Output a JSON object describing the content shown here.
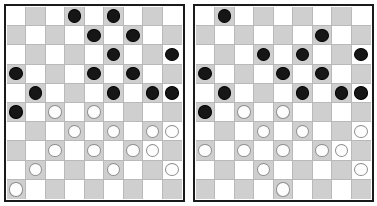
{
  "page": {
    "background": "#ffffff",
    "width": 377,
    "height": 206
  },
  "palette": {
    "light_square": "#ffffff",
    "dark_square": "#cfcfcf",
    "gridline": "#b9b9b9",
    "board_border": "#1a1a1a",
    "black_piece": "#161616",
    "white_piece": "#fdfdfd",
    "white_piece_outline": "#8e8e8e"
  },
  "boards": [
    {
      "id": "board-left",
      "label": "Left board",
      "columns": 9,
      "rows": 10,
      "piece_counts": {
        "black": 14,
        "white": 14
      },
      "pieces": [
        {
          "row": 0,
          "col": 3,
          "color": "black"
        },
        {
          "row": 0,
          "col": 5,
          "color": "black"
        },
        {
          "row": 1,
          "col": 4,
          "color": "black"
        },
        {
          "row": 1,
          "col": 6,
          "color": "black"
        },
        {
          "row": 2,
          "col": 5,
          "color": "black"
        },
        {
          "row": 2,
          "col": 8,
          "color": "black"
        },
        {
          "row": 3,
          "col": 0,
          "color": "black"
        },
        {
          "row": 3,
          "col": 4,
          "color": "black"
        },
        {
          "row": 3,
          "col": 6,
          "color": "black"
        },
        {
          "row": 4,
          "col": 1,
          "color": "black"
        },
        {
          "row": 4,
          "col": 5,
          "color": "black"
        },
        {
          "row": 4,
          "col": 7,
          "color": "black"
        },
        {
          "row": 4,
          "col": 8,
          "color": "black"
        },
        {
          "row": 5,
          "col": 0,
          "color": "black"
        },
        {
          "row": 5,
          "col": 2,
          "color": "white"
        },
        {
          "row": 5,
          "col": 4,
          "color": "white"
        },
        {
          "row": 6,
          "col": 3,
          "color": "white"
        },
        {
          "row": 6,
          "col": 5,
          "color": "white"
        },
        {
          "row": 6,
          "col": 7,
          "color": "white"
        },
        {
          "row": 6,
          "col": 8,
          "color": "white"
        },
        {
          "row": 7,
          "col": 2,
          "color": "white"
        },
        {
          "row": 7,
          "col": 4,
          "color": "white"
        },
        {
          "row": 7,
          "col": 6,
          "color": "white"
        },
        {
          "row": 7,
          "col": 7,
          "color": "white"
        },
        {
          "row": 8,
          "col": 1,
          "color": "white"
        },
        {
          "row": 8,
          "col": 5,
          "color": "white"
        },
        {
          "row": 8,
          "col": 8,
          "color": "white"
        },
        {
          "row": 9,
          "col": 0,
          "color": "white"
        }
      ]
    },
    {
      "id": "board-right",
      "label": "Right board",
      "columns": 9,
      "rows": 10,
      "piece_counts": {
        "black": 14,
        "white": 14
      },
      "pieces": [
        {
          "row": 0,
          "col": 1,
          "color": "black"
        },
        {
          "row": 1,
          "col": 6,
          "color": "black"
        },
        {
          "row": 2,
          "col": 3,
          "color": "black"
        },
        {
          "row": 2,
          "col": 5,
          "color": "black"
        },
        {
          "row": 2,
          "col": 8,
          "color": "black"
        },
        {
          "row": 3,
          "col": 0,
          "color": "black"
        },
        {
          "row": 3,
          "col": 4,
          "color": "black"
        },
        {
          "row": 3,
          "col": 6,
          "color": "black"
        },
        {
          "row": 4,
          "col": 1,
          "color": "black"
        },
        {
          "row": 4,
          "col": 5,
          "color": "black"
        },
        {
          "row": 4,
          "col": 7,
          "color": "black"
        },
        {
          "row": 4,
          "col": 8,
          "color": "black"
        },
        {
          "row": 5,
          "col": 0,
          "color": "black"
        },
        {
          "row": 5,
          "col": 2,
          "color": "white"
        },
        {
          "row": 5,
          "col": 4,
          "color": "white"
        },
        {
          "row": 6,
          "col": 3,
          "color": "white"
        },
        {
          "row": 6,
          "col": 5,
          "color": "white"
        },
        {
          "row": 6,
          "col": 8,
          "color": "white"
        },
        {
          "row": 7,
          "col": 0,
          "color": "white"
        },
        {
          "row": 7,
          "col": 2,
          "color": "white"
        },
        {
          "row": 7,
          "col": 4,
          "color": "white"
        },
        {
          "row": 7,
          "col": 6,
          "color": "white"
        },
        {
          "row": 7,
          "col": 7,
          "color": "white"
        },
        {
          "row": 8,
          "col": 3,
          "color": "white"
        },
        {
          "row": 8,
          "col": 8,
          "color": "white"
        },
        {
          "row": 9,
          "col": 4,
          "color": "white"
        }
      ]
    }
  ]
}
